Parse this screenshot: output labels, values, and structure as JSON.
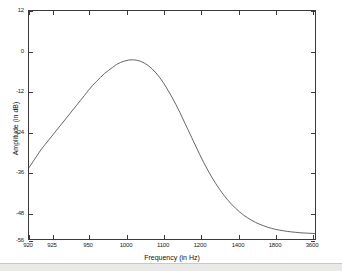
{
  "chart_data": {
    "type": "line",
    "title": "",
    "xlabel": "Frequency (in Hz)",
    "ylabel": "Amplitude (in dB)",
    "grid": false,
    "legend": null,
    "x_tick_labels": [
      "920",
      "925",
      "950",
      "1000",
      "1100",
      "1200",
      "1400",
      "1800",
      "3600"
    ],
    "x_tick_positions_px": [
      0,
      24,
      60,
      98,
      135,
      172,
      210,
      247,
      284
    ],
    "y_tick_labels": [
      "12",
      "0",
      "-12",
      "-24",
      "-36",
      "-48",
      "-56"
    ],
    "y_tick_values": [
      12,
      0,
      -12,
      -24,
      -36,
      -48,
      -56
    ],
    "ylim": [
      -56,
      12
    ],
    "xlim_labels": [
      "920",
      "3600"
    ],
    "series": [
      {
        "name": "Amplitude response",
        "color": "#555555",
        "points_px": [
          [
            0,
            158
          ],
          [
            4,
            152
          ],
          [
            8,
            146
          ],
          [
            12,
            140
          ],
          [
            16,
            135
          ],
          [
            20,
            130
          ],
          [
            24,
            125
          ],
          [
            28,
            120
          ],
          [
            32,
            115
          ],
          [
            36,
            110
          ],
          [
            40,
            105
          ],
          [
            44,
            100
          ],
          [
            48,
            95
          ],
          [
            52,
            90
          ],
          [
            56,
            85
          ],
          [
            60,
            80
          ],
          [
            64,
            75
          ],
          [
            68,
            71
          ],
          [
            72,
            67
          ],
          [
            76,
            63
          ],
          [
            80,
            60
          ],
          [
            84,
            57
          ],
          [
            88,
            54
          ],
          [
            92,
            52
          ],
          [
            96,
            50.5
          ],
          [
            100,
            49.5
          ],
          [
            104,
            49.2
          ],
          [
            108,
            49.6
          ],
          [
            112,
            50.6
          ],
          [
            116,
            52.4
          ],
          [
            120,
            55
          ],
          [
            124,
            58.4
          ],
          [
            128,
            62.6
          ],
          [
            132,
            67.6
          ],
          [
            136,
            73.4
          ],
          [
            140,
            80
          ],
          [
            144,
            87
          ],
          [
            148,
            94.5
          ],
          [
            152,
            102.5
          ],
          [
            156,
            111
          ],
          [
            160,
            119.5
          ],
          [
            164,
            128
          ],
          [
            168,
            136.5
          ],
          [
            172,
            145
          ],
          [
            176,
            153
          ],
          [
            180,
            160.5
          ],
          [
            184,
            167.5
          ],
          [
            188,
            174
          ],
          [
            192,
            180
          ],
          [
            196,
            185.5
          ],
          [
            200,
            190.5
          ],
          [
            204,
            195
          ],
          [
            208,
            199
          ],
          [
            212,
            202.6
          ],
          [
            216,
            205.8
          ],
          [
            220,
            208.6
          ],
          [
            224,
            211
          ],
          [
            228,
            213.2
          ],
          [
            232,
            215
          ],
          [
            236,
            216.6
          ],
          [
            240,
            218
          ],
          [
            244,
            219.2
          ],
          [
            248,
            220.2
          ],
          [
            252,
            221
          ],
          [
            256,
            221.7
          ],
          [
            260,
            222.3
          ],
          [
            264,
            222.8
          ],
          [
            268,
            223.2
          ],
          [
            272,
            223.6
          ],
          [
            276,
            223.9
          ],
          [
            280,
            224.1
          ],
          [
            284,
            224.3
          ],
          [
            288,
            224.5
          ]
        ]
      }
    ],
    "notes": {
      "start_value_db": -32,
      "peak_value_db": 0,
      "peak_frequency_hz": 1005,
      "floor_value_db": -56
    }
  }
}
